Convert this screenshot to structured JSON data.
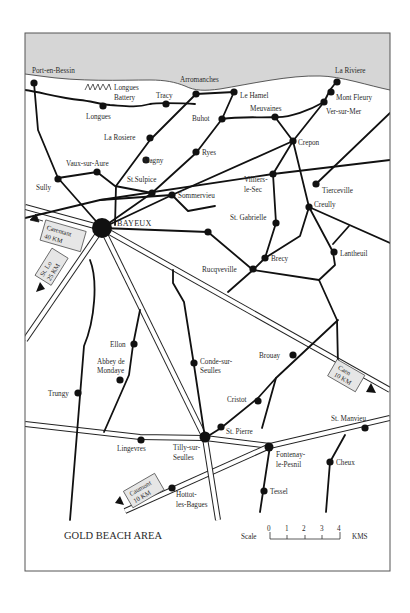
{
  "map": {
    "title": "GOLD BEACH AREA",
    "colors": {
      "sea": "#d6d6d6",
      "road": "#111111",
      "frame": "#555555",
      "sign_fill": "#e6e6e6"
    },
    "scale": {
      "label": "Scale",
      "unit": "KMS",
      "ticks": [
        "0",
        "1",
        "2",
        "3",
        "4"
      ]
    },
    "coast_labels": {
      "port_en_bessin": "Port-en-Bessin",
      "arromanches": "Arromanches",
      "la_riviere": "La Riviere"
    },
    "battery": {
      "symbol": "ʌʌʌʌ",
      "line1": "Longues",
      "line2": "Battery"
    },
    "places": {
      "longues": "Longues",
      "tracy": "Tracy",
      "le_hamel": "Le Hamel",
      "buhot": "Buhot",
      "meuvaines": "Meuvaines",
      "mont_fleury": "Mont Fleury",
      "ver_sur_mer": "Ver-sur-Mer",
      "la_rosiere": "La Rosiere",
      "ryes": "Ryes",
      "crepon": "Crepon",
      "magny": "Magny",
      "vaux_sur_aure": "Vaux-sur-Aure",
      "st_sulpice": "St.Sulpice",
      "sully": "Sully",
      "sommervieu": "Sommervieu",
      "villiers_1": "Villiers-",
      "villiers_2": "le-Sec",
      "tierceville": "Tierceville",
      "creully": "Creully",
      "st_gabrielle": "St. Gabrielle",
      "bayeux": "BAYEUX",
      "brecy": "Brecy",
      "lantheuil": "Lantheuil",
      "rucqueville": "Rucqveville",
      "ellon": "Ellon",
      "abbey_1": "Abbey de",
      "abbey_2": "Mondaye",
      "conde_1": "Conde-sur-",
      "conde_2": "Seulles",
      "brouay": "Brouay",
      "trungy": "Trungy",
      "cristot": "Cristot",
      "st_pierre": "St. Pierre",
      "st_manvieu": "St. Manvieu",
      "lingevres": "Lingevres",
      "tilly_1": "Tilly-sur-",
      "tilly_2": "Seulles",
      "fontenay_1": "Fontenay-",
      "fontenay_2": "le-Pesnil",
      "cheux": "Cheux",
      "tessel": "Tessel",
      "hottot_1": "Hottot-",
      "hottot_2": "les-Bagues"
    },
    "signs": {
      "carentan": {
        "line1": "Carentant",
        "line2": "40 KM"
      },
      "st_lo": {
        "line1": "St. Lo",
        "line2": "25 KM"
      },
      "caen": {
        "line1": "Caen",
        "line2": "10 KM"
      },
      "caumont": {
        "line1": "Caumont",
        "line2": "10 KM"
      }
    }
  }
}
